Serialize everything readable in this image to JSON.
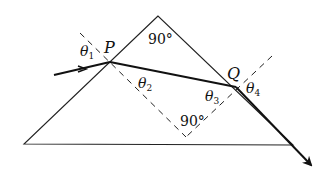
{
  "diagram": {
    "type": "prism refraction",
    "labels": {
      "point_p": "P",
      "point_q": "Q",
      "apex_angle": "90°",
      "normals_angle": "90°",
      "theta1": "θ",
      "theta1_sub": "1",
      "theta2": "θ",
      "theta2_sub": "2",
      "theta3": "θ",
      "theta3_sub": "3",
      "theta4": "θ",
      "theta4_sub": "4"
    },
    "geometry": {
      "prism": [
        [
          158,
          16
        ],
        [
          24,
          144
        ],
        [
          293,
          145
        ]
      ],
      "P": [
        110,
        62
      ],
      "Q": [
        236,
        87
      ],
      "normals_corner": [
        186,
        137
      ]
    },
    "colors": {
      "line": "#222222",
      "ray": "#111111",
      "background": "#ffffff"
    }
  }
}
